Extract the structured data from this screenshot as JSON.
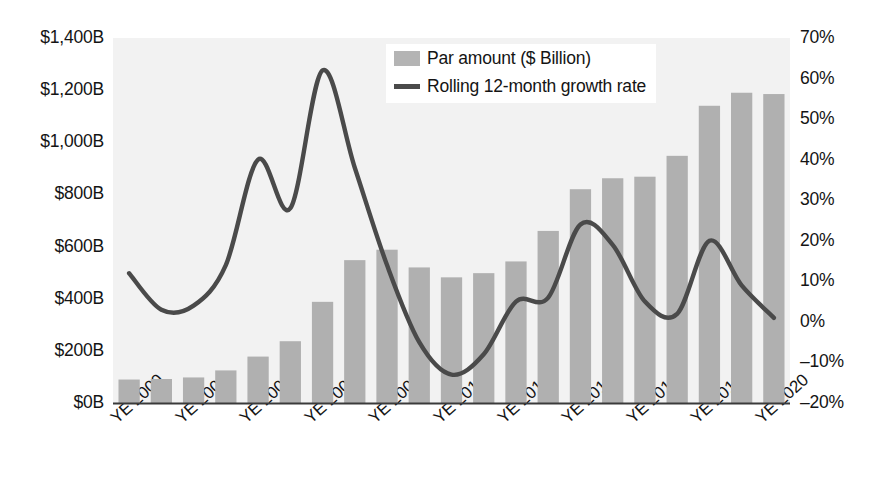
{
  "chart_data": {
    "type": "bar",
    "title": "",
    "xlabel": "",
    "ylabel": "",
    "grid": false,
    "legend_position": "top-center-right",
    "categories": [
      "YE 2000",
      "YE 2001",
      "YE 2002",
      "YE 2003",
      "YE 2004",
      "YE 2005",
      "YE 2006",
      "YE 2007",
      "YE 2008",
      "YE 2009",
      "YE 2010",
      "YE 2011",
      "YE 2012",
      "YE 2013",
      "YE 2014",
      "YE 2015",
      "YE 2016",
      "YE 2017",
      "YE 2018",
      "YE 2019",
      "YE 2020"
    ],
    "x_tick_labels": [
      "YE 2000",
      "YE 2002",
      "YE 2004",
      "YE 2006",
      "YE 2008",
      "YE 2010",
      "YE 2012",
      "YE 2014",
      "YE 2016",
      "YE 2018",
      "YE 2020"
    ],
    "left_axis": {
      "label": "",
      "ticks": [
        "$0B",
        "$200B",
        "$400B",
        "$600B",
        "$800B",
        "$1,000B",
        "$1,200B",
        "$1,400B"
      ],
      "tick_values": [
        0,
        200,
        400,
        600,
        800,
        1000,
        1200,
        1400
      ],
      "ylim": [
        0,
        1400
      ],
      "unit": "$ Billion"
    },
    "right_axis": {
      "label": "",
      "ticks": [
        "-20%",
        "-10%",
        "0%",
        "10%",
        "20%",
        "30%",
        "40%",
        "50%",
        "60%",
        "70%"
      ],
      "tick_values": [
        -20,
        -10,
        0,
        10,
        20,
        30,
        40,
        50,
        60,
        70
      ],
      "ylim": [
        -20,
        70
      ],
      "unit": "%"
    },
    "series": [
      {
        "name": "Par amount ($ Billion)",
        "type": "bar",
        "axis": "left",
        "color": "#b0b0b0",
        "values": [
          90,
          92,
          98,
          125,
          178,
          237,
          388,
          548,
          588,
          520,
          482,
          498,
          543,
          660,
          820,
          862,
          868,
          948,
          1140,
          1190,
          1185
        ]
      },
      {
        "name": "Rolling 12-month growth rate",
        "type": "line",
        "axis": "right",
        "color": "#4a4a4a",
        "values": [
          12,
          3,
          4,
          14,
          40,
          28,
          62,
          38,
          14,
          -5,
          -13,
          -8,
          5,
          6,
          24,
          19,
          5,
          2,
          20,
          9,
          1
        ]
      }
    ]
  },
  "legend": {
    "items": [
      {
        "label": "Par amount ($ Billion)",
        "marker": "bar-swatch"
      },
      {
        "label": "Rolling 12-month growth rate",
        "marker": "line-swatch"
      }
    ]
  },
  "colors": {
    "bar": "#b0b0b0",
    "line": "#4a4a4a",
    "plot_background": "#f2f2f2",
    "axis": "#3a3a3a",
    "text": "#141414",
    "page_background": "#ffffff"
  }
}
